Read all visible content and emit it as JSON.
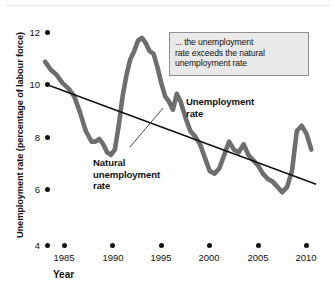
{
  "chart_data": {
    "type": "line",
    "title": "",
    "xlabel": "Year",
    "ylabel": "Unemployment rate (percentage of labour force)",
    "xlim": [
      1983,
      2011
    ],
    "ylim": [
      4,
      12
    ],
    "xticks": [
      "1985",
      "1990",
      "1995",
      "2000",
      "2005",
      "2010"
    ],
    "yticks": [
      "4",
      "6",
      "8",
      "10",
      "12"
    ],
    "grid": false,
    "legend_position": "inline-annotations",
    "series": [
      {
        "name": "Unemployment rate",
        "color": "#6e6e6e",
        "x": [
          1983.0,
          1983.6,
          1984.2,
          1984.8,
          1985.4,
          1986.0,
          1986.6,
          1987.2,
          1987.8,
          1988.2,
          1988.6,
          1989.0,
          1989.4,
          1989.8,
          1990.2,
          1990.6,
          1991.0,
          1991.4,
          1991.8,
          1992.2,
          1992.6,
          1993.0,
          1993.4,
          1993.8,
          1994.2,
          1994.6,
          1995.0,
          1995.4,
          1995.8,
          1996.2,
          1996.6,
          1997.0,
          1997.5,
          1998.0,
          1998.5,
          1999.0,
          1999.5,
          2000.0,
          2000.5,
          2001.0,
          2001.5,
          2002.0,
          2002.5,
          2003.0,
          2003.5,
          2004.0,
          2004.5,
          2005.0,
          2005.5,
          2006.0,
          2006.5,
          2007.0,
          2007.5,
          2008.0,
          2008.5,
          2009.0,
          2009.5,
          2010.0,
          2010.5
        ],
        "y": [
          10.9,
          10.6,
          10.4,
          10.1,
          9.9,
          9.6,
          9.0,
          8.3,
          7.9,
          7.9,
          8.0,
          7.8,
          7.5,
          7.4,
          7.6,
          8.5,
          9.6,
          10.4,
          11.0,
          11.3,
          11.7,
          11.8,
          11.6,
          11.3,
          11.2,
          10.7,
          10.1,
          9.6,
          9.4,
          9.1,
          9.7,
          9.4,
          8.8,
          8.3,
          8.1,
          7.8,
          7.3,
          6.8,
          6.7,
          6.9,
          7.4,
          7.9,
          7.6,
          7.5,
          7.8,
          7.4,
          7.2,
          7.0,
          6.7,
          6.5,
          6.4,
          6.2,
          6.0,
          6.2,
          6.8,
          8.3,
          8.5,
          8.2,
          7.6
        ],
        "description": "Actual unemployment rate, fluctuating around the natural rate"
      },
      {
        "name": "Natural unemployment rate",
        "color": "#111111",
        "x": [
          1983.5,
          2011.0
        ],
        "y": [
          10.0,
          6.3
        ],
        "description": "Downward-sloping straight trend line"
      }
    ],
    "annotations": [
      {
        "name": "callout",
        "text": "... the unemployment rate exceeds the natural unemployment rate"
      },
      {
        "name": "unemployment-rate-label",
        "text": "Unemployment\nrate"
      },
      {
        "name": "natural-rate-label",
        "text": "Natural\nunemployment\nrate"
      }
    ]
  },
  "axes": {
    "y_title": "Unemployment rate (percentage of labour force)",
    "x_title": "Year",
    "y_ticks": [
      {
        "label": "12",
        "value": 12
      },
      {
        "label": "10",
        "value": 10
      },
      {
        "label": "8",
        "value": 8
      },
      {
        "label": "6",
        "value": 6
      },
      {
        "label": "4",
        "value": 4
      }
    ],
    "x_ticks": [
      {
        "label": "1985",
        "value": 1985
      },
      {
        "label": "1990",
        "value": 1990
      },
      {
        "label": "1995",
        "value": 1995
      },
      {
        "label": "2000",
        "value": 2000
      },
      {
        "label": "2005",
        "value": 2005
      },
      {
        "label": "2010",
        "value": 2010
      }
    ]
  },
  "labels": {
    "callout_line1": "... the unemployment",
    "callout_line2": "rate exceeds the natural",
    "callout_line3": "unemployment rate",
    "unemployment_line1": "Unemployment",
    "unemployment_line2": "rate",
    "natural_line1": "Natural",
    "natural_line2": "unemployment",
    "natural_line3": "rate"
  },
  "colors": {
    "series_unemployment": "#6e6e6e",
    "series_natural": "#111111",
    "callout_fill": "#e9e9e9",
    "callout_border": "#8f8f8f",
    "text": "#111111",
    "background": "#ffffff"
  }
}
